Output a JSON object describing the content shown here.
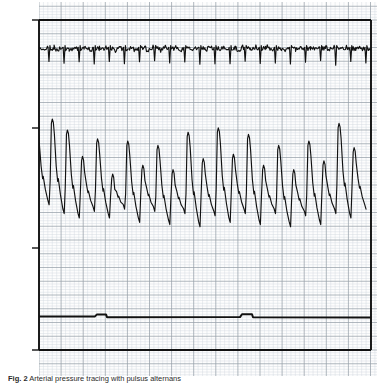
{
  "figure": {
    "type": "physiologic-recording",
    "ylabel": "mmHg",
    "lead_label": "III",
    "caption_prefix": "Fig. 2",
    "caption_text": "Arterial pressure tracing with pulsus alternans"
  },
  "axis": {
    "tick_labels": [
      "150",
      "100",
      "50",
      "0"
    ],
    "tick_values": [
      150,
      100,
      50,
      0
    ],
    "ymin": 0,
    "ymax": 150,
    "units": "mmHg"
  },
  "chart_data": {
    "type": "line",
    "title": "",
    "xlabel": "",
    "ylabel": "mmHg",
    "ylim": [
      0,
      150
    ],
    "grid": true,
    "legend": "none",
    "series": [
      {
        "name": "ECG lead III",
        "label": "III",
        "baseline": 137,
        "beat_count": 22,
        "comment": "ECG rhythm strip riding near 137 mmHg scale position, small downward QRS deflections"
      },
      {
        "name": "Arterial pressure",
        "comment": "Pulsus alternans: alternating large and small systolic peaks",
        "systolic_peaks": [
          101,
          105,
          100,
          88,
          96,
          80,
          95,
          84,
          93,
          82,
          99,
          87,
          101,
          89,
          98,
          84,
          93,
          82,
          95,
          86,
          103,
          92
        ],
        "diastolic_troughs": [
          66,
          62,
          60,
          63,
          60,
          64,
          58,
          63,
          57,
          62,
          56,
          61,
          58,
          62,
          57,
          62,
          56,
          61,
          57,
          62,
          60,
          64
        ]
      },
      {
        "name": "Respiration / reference channel",
        "value": 15,
        "comment": "Near-flat trace with two small square calibration notches"
      },
      {
        "name": "Zero baseline",
        "value": 0,
        "comment": "Heavy flat zero-pressure reference line"
      }
    ]
  },
  "colors": {
    "trace": "#111111",
    "grid_major": "#9aa3ad",
    "grid_minor": "#cfd6dd",
    "paper": "#fdfdfd",
    "text": "#1a1a1a"
  }
}
